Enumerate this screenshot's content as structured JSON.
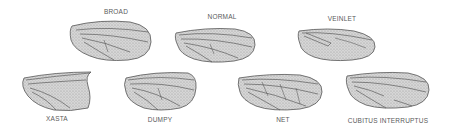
{
  "figure": {
    "colors": {
      "wing_fill": "#c9c9c9",
      "wing_outline": "#555555",
      "vein": "#4a4a4a",
      "label": "#5a5a5a"
    },
    "wings": [
      {
        "label": "BROAD",
        "label_x": 116,
        "label_y": 8
      },
      {
        "label": "NORMAL",
        "label_x": 222,
        "label_y": 13
      },
      {
        "label": "VEINLET",
        "label_x": 342,
        "label_y": 15
      },
      {
        "label": "XASTA",
        "label_x": 57,
        "label_y": 115
      },
      {
        "label": "DUMPY",
        "label_x": 160,
        "label_y": 116
      },
      {
        "label": "NET",
        "label_x": 283,
        "label_y": 116
      },
      {
        "label": "CUBITUS INTERRUPTUS",
        "label_x": 388,
        "label_y": 117
      }
    ]
  }
}
